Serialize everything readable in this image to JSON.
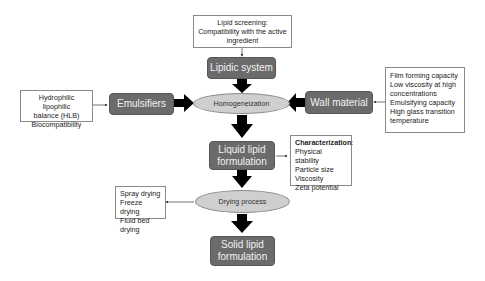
{
  "diagram": {
    "nodes": {
      "lipid_screening": {
        "lines": [
          "Lipid screening:",
          "Compatibility with the active",
          "ingredient"
        ]
      },
      "lipidic_system": {
        "label": "Lipidic system"
      },
      "hlb_note": {
        "lines": [
          "Hydrophilic lipophilic",
          "balance (HLB)",
          "Biocompatibility"
        ]
      },
      "emulsifiers": {
        "label": "Emulsifiers"
      },
      "homogeneization": {
        "label": "Homogeneization"
      },
      "wall_material": {
        "label": "Wall material"
      },
      "wall_note": {
        "lines": [
          "Film forming capacity",
          "Low viscosity at high",
          "concentrations",
          "Emulsifying capacity",
          "High glass transition",
          "temperature"
        ]
      },
      "liquid_formulation": {
        "lines": [
          "Liquid lipid",
          "formulation"
        ]
      },
      "characterization": {
        "heading": "Characterization",
        "heading_suffix": ":",
        "lines": [
          "Physical stability",
          "Particle size",
          "Viscosity",
          "Zeta potential"
        ]
      },
      "drying_process": {
        "label": "Drying process"
      },
      "drying_note": {
        "lines": [
          "Spray drying",
          "Freeze drying",
          "Fluid bed drying"
        ]
      },
      "solid_formulation": {
        "lines": [
          "Solid lipid",
          "formulation"
        ]
      }
    },
    "edges": [
      {
        "from": "lipid_screening",
        "to": "lipidic_system",
        "style": "thin"
      },
      {
        "from": "lipidic_system",
        "to": "homogeneization",
        "style": "thick"
      },
      {
        "from": "hlb_note",
        "to": "emulsifiers",
        "style": "thin"
      },
      {
        "from": "emulsifiers",
        "to": "homogeneization",
        "style": "thick"
      },
      {
        "from": "wall_note",
        "to": "wall_material",
        "style": "thin"
      },
      {
        "from": "wall_material",
        "to": "homogeneization",
        "style": "thick"
      },
      {
        "from": "homogeneization",
        "to": "liquid_formulation",
        "style": "thick"
      },
      {
        "from": "liquid_formulation",
        "to": "characterization",
        "style": "thin"
      },
      {
        "from": "liquid_formulation",
        "to": "drying_process",
        "style": "thick"
      },
      {
        "from": "drying_process",
        "to": "drying_note",
        "style": "thin"
      },
      {
        "from": "drying_process",
        "to": "solid_formulation",
        "style": "thick"
      }
    ],
    "colors": {
      "process_box": "#6b6b6b",
      "ellipse_fill": "#cfcfcf",
      "arrow": "#000000",
      "note_border": "#8a8a8a"
    }
  }
}
